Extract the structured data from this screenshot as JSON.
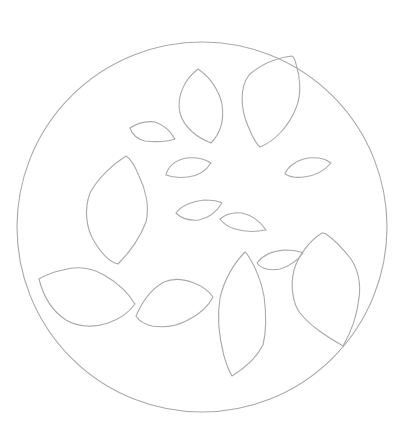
{
  "drawing": {
    "background": "#ffffff",
    "stroke_color": "#a9a9a9",
    "circle": {
      "cx": 202,
      "cy": 227,
      "r": 185
    },
    "leaves": [
      {
        "name": "leaf-top-center",
        "d": "M198,69 C186,78 176,95 180,113 C184,128 198,138 211,143 C222,132 224,118 222,104 C219,90 209,76 198,69 Z"
      },
      {
        "name": "leaf-top-right-large",
        "d": "M292,56 C276,58 260,65 249,75 C239,88 241,110 248,126 C252,136 256,144 260,147 C275,141 289,126 296,108 C302,94 300,76 296,64 C295,60 294,57 292,56 Z"
      },
      {
        "name": "leaf-small-upper-left",
        "d": "M130,128 C138,123 148,121 155,122 C164,125 171,132 175,139 C166,142 154,142 145,141 C137,139 132,134 130,128 Z"
      },
      {
        "name": "leaf-small-center-1",
        "d": "M166,175 C168,166 176,160 186,158 C196,157 205,159 211,163 C206,171 198,176 188,177 C179,178 171,177 166,175 Z"
      },
      {
        "name": "leaf-small-right",
        "d": "M285,174 C288,166 297,160 308,158 C317,157 326,159 331,163 C325,170 315,176 304,177 C297,178 290,177 285,174 Z"
      },
      {
        "name": "leaf-left-tall",
        "d": "M126,156 C113,164 98,178 90,193 C84,209 86,228 94,241 C101,253 110,262 118,264 C128,254 140,238 146,222 C150,206 145,188 139,176 C135,166 131,159 126,156 Z"
      },
      {
        "name": "leaf-small-center-2",
        "d": "M176,213 C181,206 192,201 204,200 C212,200 219,201 222,203 C217,211 209,218 199,220 C189,221 181,218 176,213 Z"
      },
      {
        "name": "leaf-small-center-3",
        "d": "M220,219 C226,214 234,212 242,213 C251,215 260,221 266,230 C256,232 245,232 235,229 C228,227 223,223 220,219 Z"
      },
      {
        "name": "leaf-small-lower-right",
        "d": "M257,263 C262,256 272,251 284,250 C292,250 299,251 303,253 C298,260 290,266 280,269 C270,271 261,269 257,263 Z"
      },
      {
        "name": "leaf-right-large",
        "d": "M322,233 C310,240 298,256 294,270 C290,286 293,304 300,313 C311,327 328,337 343,346 C350,334 357,316 359,298 C361,284 358,270 351,259 C343,249 335,240 326,234 C325,233 324,233 322,233 Z"
      },
      {
        "name": "leaf-center-tall",
        "d": "M245,252 C234,263 224,280 220,298 C217,316 219,337 224,356 C227,366 230,373 232,376 C245,368 257,357 263,345 C267,329 266,311 264,296 C261,280 254,265 249,257 C247,254 246,252 245,252 Z"
      },
      {
        "name": "leaf-lower-left",
        "d": "M39,279 C43,295 52,311 66,320 C78,327 94,328 108,323 C120,319 130,311 135,304 C129,294 118,283 104,275 C92,268 77,266 63,270 C53,272 44,276 39,279 Z"
      },
      {
        "name": "leaf-lower-center-left",
        "d": "M136,316 C142,302 151,289 164,282 C173,278 184,279 194,283 C202,286 209,291 213,297 C209,305 200,314 188,320 C177,326 164,328 152,326 C144,324 139,321 136,316 Z"
      }
    ]
  }
}
